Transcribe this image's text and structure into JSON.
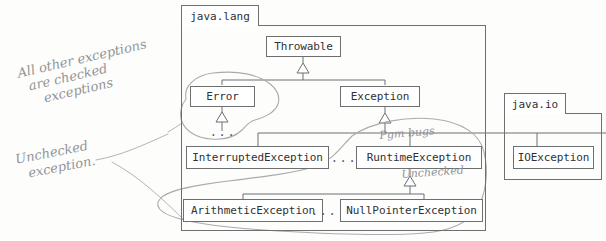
{
  "diagram": {
    "kind": "uml-class-hierarchy",
    "background_color": "#fdfdfc",
    "line_color": "#6d6f71",
    "text_color": "#2f3133",
    "annotation_color": "#8d8f92"
  },
  "packages": [
    {
      "id": "java-lang",
      "label": "java.lang"
    },
    {
      "id": "java-io",
      "label": "java.io"
    }
  ],
  "classes": [
    {
      "id": "throwable",
      "label": "Throwable",
      "package": "java.lang"
    },
    {
      "id": "error",
      "label": "Error",
      "package": "java.lang"
    },
    {
      "id": "exception",
      "label": "Exception",
      "package": "java.lang"
    },
    {
      "id": "interrupted-exception",
      "label": "InterruptedException",
      "package": "java.lang"
    },
    {
      "id": "runtime-exception",
      "label": "RuntimeException",
      "package": "java.lang"
    },
    {
      "id": "arithmetic-exception",
      "label": "ArithmeticException",
      "package": "java.lang"
    },
    {
      "id": "nullpointer-exception",
      "label": "NullPointerException",
      "package": "java.lang"
    },
    {
      "id": "io-exception",
      "label": "IOException",
      "package": "java.io"
    }
  ],
  "ellipses": [
    {
      "id": "ellipsis-under-error",
      "label": "..."
    },
    {
      "id": "ellipsis-checked-row",
      "label": "..."
    },
    {
      "id": "ellipsis-unchecked-row",
      "label": "..."
    }
  ],
  "inheritance": [
    {
      "child": "error",
      "parent": "throwable"
    },
    {
      "child": "exception",
      "parent": "throwable"
    },
    {
      "child": "interrupted-exception",
      "parent": "exception"
    },
    {
      "child": "runtime-exception",
      "parent": "exception"
    },
    {
      "child": "io-exception",
      "parent": "exception"
    },
    {
      "child": "arithmetic-exception",
      "parent": "runtime-exception"
    },
    {
      "child": "nullpointer-exception",
      "parent": "runtime-exception"
    }
  ],
  "annotations": [
    {
      "id": "note-checked",
      "text": "All other exceptions",
      "line2": "are checked",
      "line3": "exceptions"
    },
    {
      "id": "note-unchecked",
      "text": "Unchecked",
      "line2": "exception."
    },
    {
      "id": "note-pgm-bugs",
      "text": "Pgm bugs"
    },
    {
      "id": "note-unchecked-inline",
      "text": "Unchecked"
    }
  ],
  "circles": [
    {
      "id": "circle-error-group",
      "encircles": "Error"
    },
    {
      "id": "circle-unchecked-group",
      "encircles": "RuntimeException subtree"
    }
  ]
}
